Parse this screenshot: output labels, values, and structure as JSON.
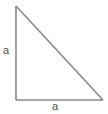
{
  "figure": {
    "type": "right-triangle-diagram",
    "background_color": "#ffffff",
    "stroke_color": "#888888",
    "label_color": "#4d4d4d",
    "stroke_width": 1.6,
    "labels": {
      "vertical_leg": "a",
      "horizontal_leg": "a"
    },
    "geometry": {
      "apex": {
        "x": 16,
        "y": 6
      },
      "right_angle_vertex": {
        "x": 16,
        "y": 100
      },
      "right_vertex": {
        "x": 103,
        "y": 100
      },
      "vertical_leg_length": 94,
      "horizontal_leg_length": 87
    }
  }
}
